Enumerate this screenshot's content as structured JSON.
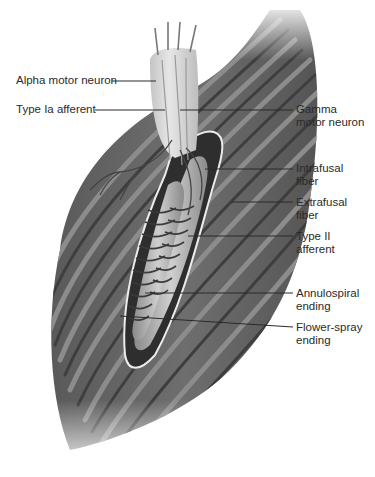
{
  "figure": {
    "colors": {
      "background": "#ffffff",
      "muscle_dark": "#4a4a4a",
      "muscle_mid": "#7a7a7a",
      "muscle_light": "#a8a8a8",
      "spindle_fill": "#b9b9b9",
      "capsule_outline": "#e8e8e8",
      "nerve_bundle": "#d8d8d8",
      "leader_line": "#2a2a2a",
      "label_text": "#2a2a2a"
    },
    "labels_left": [
      {
        "id": "alpha",
        "line1": "Alpha motor neuron",
        "line2": ""
      },
      {
        "id": "ia",
        "line1": "Type Ia afferent",
        "line2": ""
      }
    ],
    "labels_right": [
      {
        "id": "gamma",
        "line1": "Gamma",
        "line2": "motor neuron"
      },
      {
        "id": "intrafusal",
        "line1": "Intrafusal",
        "line2": "fiber"
      },
      {
        "id": "extrafusal",
        "line1": "Extrafusal",
        "line2": "fiber"
      },
      {
        "id": "type2",
        "line1": "Type II",
        "line2": "afferent"
      },
      {
        "id": "annulo",
        "line1": "Annulospiral",
        "line2": "ending"
      },
      {
        "id": "flower",
        "line1": "Flower-spray",
        "line2": "ending"
      }
    ]
  }
}
